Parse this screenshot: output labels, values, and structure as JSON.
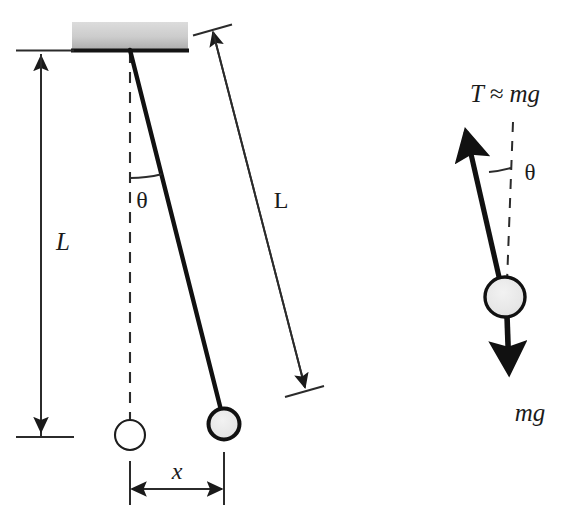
{
  "figure": {
    "colors": {
      "ink": "#1a1a1a",
      "stroke": "#222222",
      "bob_fill": "#e8e8e8",
      "ceiling_fill_top": "#d9d9d9",
      "ceiling_fill_bottom": "#b7b7b7",
      "background": "#ffffff"
    }
  },
  "left_diagram": {
    "name": "pendulum-displacement-diagram",
    "labels": {
      "vertical_length": "L",
      "diagonal_length": "L",
      "angle": "θ",
      "horizontal_displacement": "x"
    },
    "elements": {
      "ceiling_block": "ceiling-support-block",
      "pivot": "pivot-point",
      "rod": "pendulum-rod",
      "equilibrium_line": "equilibrium-dashed-line",
      "rest_bob": "pendulum-bob-rest",
      "displaced_bob": "pendulum-bob-displaced",
      "angle_arc": "angle-arc",
      "vertical_dimension": "vertical-length-dimension",
      "diagonal_dimension": "diagonal-length-dimension",
      "horizontal_dimension": "horizontal-displacement-dimension"
    },
    "geometry": {
      "pivot_x": 130,
      "pivot_y": 48,
      "rest_bob_x": 130,
      "rest_bob_y": 435,
      "displaced_bob_x": 224,
      "displaced_bob_y": 424,
      "angle_degrees": 14
    }
  },
  "right_diagram": {
    "name": "free-body-diagram",
    "labels": {
      "tension": "T ≈ mg",
      "angle": "θ",
      "weight": "mg"
    },
    "elements": {
      "tension_arrow": "tension-force-arrow",
      "weight_arrow": "weight-force-arrow",
      "bob": "free-body-bob",
      "vertical_reference": "vertical-dashed-reference",
      "angle_arc": "angle-arc"
    },
    "geometry": {
      "bob_x": 504,
      "bob_y": 297,
      "tension_tip_x": 460,
      "tension_tip_y": 120,
      "weight_tip_x": 509,
      "weight_tip_y": 390,
      "angle_degrees": 14
    }
  }
}
